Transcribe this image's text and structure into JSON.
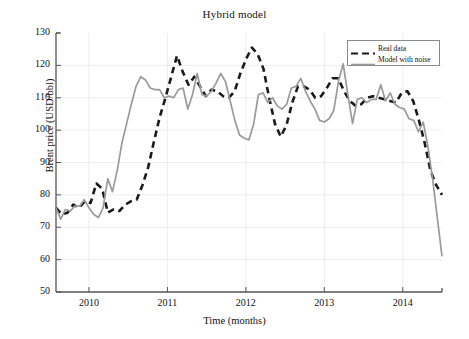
{
  "chart_data": {
    "type": "line",
    "title": "Hybrid model",
    "xlabel": "Time (months)",
    "ylabel": "Brent price (USD/bbl)",
    "xlim": [
      2009.58,
      2014.5
    ],
    "ylim": [
      50,
      130
    ],
    "xticks": [
      2010,
      2011,
      2012,
      2013,
      2014
    ],
    "xticklabels": [
      "2010",
      "2011",
      "2012",
      "2013",
      "2014"
    ],
    "yticks": [
      50,
      60,
      70,
      80,
      90,
      100,
      110,
      120,
      130
    ],
    "yticklabels": [
      "50",
      "60",
      "70",
      "80",
      "90",
      "100",
      "110",
      "120",
      "130"
    ],
    "grid": true,
    "legend_position": "upper right",
    "colors": {
      "real_data": "#1a1a1a",
      "model_with_noise": "#9a9a9a",
      "grid": "#ededed",
      "axis": "#555555",
      "background": "#ffffff"
    },
    "x": [
      2009.583,
      2009.667,
      2009.75,
      2009.833,
      2009.917,
      2010.0,
      2010.083,
      2010.167,
      2010.25,
      2010.333,
      2010.417,
      2010.5,
      2010.583,
      2010.667,
      2010.75,
      2010.833,
      2010.917,
      2011.0,
      2011.083,
      2011.167,
      2011.25,
      2011.333,
      2011.417,
      2011.5,
      2011.583,
      2011.667,
      2011.75,
      2011.833,
      2011.917,
      2012.0,
      2012.083,
      2012.167,
      2012.25,
      2012.333,
      2012.417,
      2012.5,
      2012.583,
      2012.667,
      2012.75,
      2012.833,
      2012.917,
      2013.0,
      2013.083,
      2013.167,
      2013.25,
      2013.333,
      2013.417,
      2013.5,
      2013.583,
      2013.667,
      2013.75,
      2013.833,
      2013.917,
      2014.0,
      2014.083,
      2014.167,
      2014.25,
      2014.333,
      2014.417,
      2014.5
    ],
    "series": [
      {
        "name": "Real data",
        "style": "dashed",
        "color": "#1a1a1a",
        "values": [
          76.0,
          74.0,
          74.5,
          77.0,
          76.0,
          78.0,
          77.5,
          83.5,
          82.0,
          74.5,
          75.5,
          75.0,
          77.0,
          78.0,
          78.5,
          83.0,
          88.5,
          96.5,
          104.0,
          110.0,
          116.5,
          123.0,
          118.0,
          114.0,
          116.5,
          113.5,
          110.5,
          112.5,
          112.0,
          110.5,
          110.0,
          112.0,
          117.5,
          122.0,
          125.5,
          123.5,
          119.0,
          110.0,
          102.0,
          98.0,
          101.5,
          108.5,
          113.5,
          113.5,
          112.5,
          110.0,
          110.5,
          113.0,
          116.0,
          116.0,
          112.0,
          109.0,
          107.5,
          108.0,
          110.0,
          110.5,
          110.0,
          109.5,
          109.0,
          108.5
        ],
        "values_tail": [
          111.5,
          112.0,
          109.0,
          103.0,
          96.0,
          87.5,
          83.0,
          80.0
        ]
      },
      {
        "name": "Model with noise",
        "style": "solid",
        "color": "#9a9a9a",
        "values": [
          76.0,
          72.5,
          75.5,
          75.0,
          76.5,
          76.5,
          78.5,
          76.0,
          74.0,
          73.0,
          76.0,
          85.0,
          81.0,
          87.5,
          96.0,
          102.0,
          108.0,
          113.5,
          116.5,
          115.5,
          113.0,
          112.5,
          112.5,
          110.0,
          110.5,
          110.0,
          112.5,
          113.0,
          106.5,
          111.0,
          117.5,
          111.0,
          110.5,
          112.0,
          114.5,
          117.5,
          115.0,
          109.0,
          103.0,
          98.5,
          97.5,
          97.0,
          102.0,
          111.0,
          111.5,
          108.5,
          110.0,
          107.5,
          106.5,
          108.0,
          113.0,
          113.5,
          116.0,
          112.0,
          109.0,
          106.5,
          103.0,
          102.5,
          103.5,
          106.0
        ],
        "values_tail": [
          115.0,
          120.5,
          111.0,
          102.0,
          109.5,
          110.0,
          108.5,
          109.5,
          109.5,
          114.0,
          109.0,
          111.5,
          108.0,
          107.0,
          106.5,
          103.5,
          103.0,
          99.5,
          102.5,
          95.0,
          85.0,
          73.0,
          61.0
        ]
      }
    ]
  },
  "legend": {
    "entries": [
      {
        "label": "Real data",
        "style": "dashed"
      },
      {
        "label": "Model with noise",
        "style": "solid"
      }
    ]
  }
}
